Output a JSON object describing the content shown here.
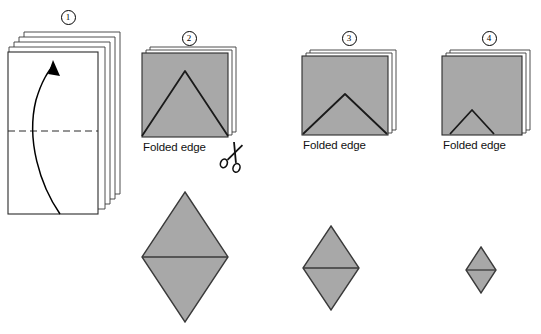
{
  "figure": {
    "background_color": "#ffffff",
    "paper_fill": "#a8a8a8",
    "paper_stroke": "#1a1a1a",
    "sheet_fill": "#ffffff",
    "sheet_stroke": "#333333"
  },
  "steps": [
    {
      "id": 1,
      "number_label": "1",
      "name": "stack-of-sheets-fold",
      "caption": "",
      "description": "Stack of sheets with horizontal dashed fold line and curved upward arrow"
    },
    {
      "id": 2,
      "number_label": "2",
      "name": "folded-square-large-triangle",
      "caption": "Folded edge",
      "description": "Folded square sheets with large inverted-V cut line, scissors at lower right"
    },
    {
      "id": 3,
      "number_label": "3",
      "name": "folded-square-medium-triangle",
      "caption": "Folded edge",
      "description": "Folded sheets with medium inverted-V cut line"
    },
    {
      "id": 4,
      "number_label": "4",
      "name": "folded-square-small-triangle",
      "caption": "Folded edge",
      "description": "Folded sheets with small inverted-V cut line"
    }
  ],
  "results": [
    {
      "name": "diamond-large",
      "size": "large",
      "width_px": 86,
      "height_px": 130
    },
    {
      "name": "diamond-medium",
      "size": "medium",
      "width_px": 56,
      "height_px": 84
    },
    {
      "name": "diamond-small",
      "size": "small",
      "width_px": 30,
      "height_px": 46
    }
  ],
  "icons": {
    "scissors": "scissors-icon",
    "arrow": "fold-arrow-icon",
    "fold_line": "dashed-fold-line"
  }
}
